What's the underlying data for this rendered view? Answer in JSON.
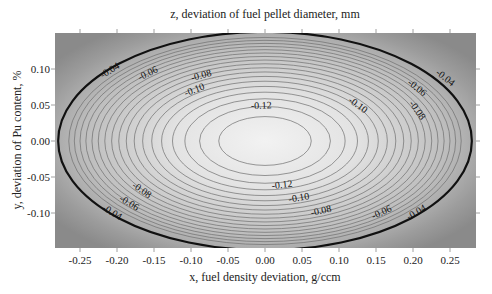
{
  "chart_data": {
    "type": "heatmap",
    "subtype": "contour",
    "title": "z, deviation of fuel pellet diameter, mm",
    "xlabel": "x, fuel density deviation, g/ccm",
    "ylabel": "y, deviation of Pu content, %",
    "xlim": [
      -0.285,
      0.285
    ],
    "ylim": [
      -0.148,
      0.148
    ],
    "x_ticks": [
      "-0.25",
      "-0.20",
      "-0.15",
      "-0.10",
      "-0.05",
      "0.00",
      "0.05",
      "0.10",
      "0.15",
      "0.20",
      "0.25"
    ],
    "y_ticks": [
      "0.10",
      "0.05",
      "0.00",
      "-0.05",
      "-0.10"
    ],
    "grid": false,
    "legend": null,
    "colormap": "grayscale, lighter toward center (minimum)",
    "center": {
      "x": 0.0,
      "y": 0.0,
      "z_min_approx": -0.13
    },
    "contour_levels": [
      -0.13,
      -0.125,
      -0.12,
      -0.115,
      -0.11,
      -0.105,
      -0.1,
      -0.095,
      -0.09,
      -0.085,
      -0.08,
      -0.075,
      -0.07,
      -0.065,
      -0.06,
      -0.055,
      -0.05,
      -0.045,
      -0.04,
      -0.03
    ],
    "labeled_levels": [
      "-0.04",
      "-0.06",
      "-0.08",
      "-0.10",
      "-0.12"
    ],
    "bold_contour_level": -0.03,
    "contour_labels": [
      {
        "text": "-0.04",
        "x": -0.209,
        "y": 0.097
      },
      {
        "text": "-0.06",
        "x": -0.158,
        "y": 0.093
      },
      {
        "text": "-0.08",
        "x": -0.086,
        "y": 0.09
      },
      {
        "text": "-0.10",
        "x": -0.095,
        "y": 0.07
      },
      {
        "text": "-0.12",
        "x": -0.005,
        "y": 0.048
      },
      {
        "text": "-0.10",
        "x": 0.125,
        "y": 0.049
      },
      {
        "text": "-0.08",
        "x": 0.205,
        "y": 0.042
      },
      {
        "text": "-0.06",
        "x": 0.205,
        "y": 0.073
      },
      {
        "text": "-0.04",
        "x": 0.243,
        "y": 0.087
      },
      {
        "text": "-0.08",
        "x": -0.167,
        "y": -0.069
      },
      {
        "text": "-0.06",
        "x": -0.184,
        "y": -0.087
      },
      {
        "text": "-0.04",
        "x": -0.207,
        "y": -0.1
      },
      {
        "text": "-0.12",
        "x": 0.023,
        "y": -0.062
      },
      {
        "text": "-0.10",
        "x": 0.046,
        "y": -0.08
      },
      {
        "text": "-0.08",
        "x": 0.076,
        "y": -0.098
      },
      {
        "text": "-0.06",
        "x": 0.158,
        "y": -0.1
      },
      {
        "text": "-0.04",
        "x": 0.205,
        "y": -0.1
      }
    ]
  }
}
